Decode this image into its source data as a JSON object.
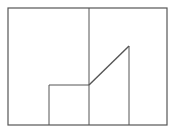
{
  "diagram": {
    "width": 172,
    "height": 133,
    "stroke_color": "#555555",
    "background": "#ffffff",
    "frame": {
      "x": 8,
      "y": 8,
      "w": 159,
      "h": 117
    },
    "lines": [
      {
        "id": "center-divider",
        "x1": 89,
        "y1": 8,
        "x2": 89,
        "y2": 125
      },
      {
        "id": "step-left-vertical",
        "x1": 49,
        "y1": 85,
        "x2": 49,
        "y2": 125
      },
      {
        "id": "step-horizontal",
        "x1": 49,
        "y1": 85,
        "x2": 89,
        "y2": 85
      },
      {
        "id": "ramp-diagonal",
        "x1": 89,
        "y1": 85,
        "x2": 129,
        "y2": 46
      },
      {
        "id": "ramp-right-vertical",
        "x1": 129,
        "y1": 46,
        "x2": 129,
        "y2": 125
      }
    ]
  }
}
